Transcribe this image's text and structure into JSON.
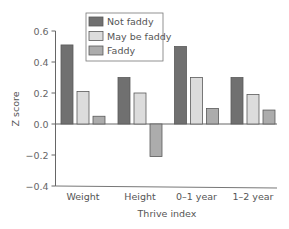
{
  "chart_data": {
    "type": "bar",
    "title": "",
    "xlabel": "Thrive index",
    "ylabel": "Z score",
    "categories": [
      "Weight",
      "Height",
      "0–1 year",
      "1–2 year"
    ],
    "series": [
      {
        "name": "Not faddy",
        "values": [
          0.51,
          0.3,
          0.5,
          0.3
        ],
        "color": "#707070"
      },
      {
        "name": "May be faddy",
        "values": [
          0.21,
          0.2,
          0.3,
          0.19
        ],
        "color": "#dcdcdc"
      },
      {
        "name": "Faddy",
        "values": [
          0.05,
          -0.21,
          0.1,
          0.09
        ],
        "color": "#acacac"
      }
    ],
    "ylim": [
      -0.4,
      0.6
    ],
    "yticks": [
      0.6,
      0.4,
      0.2,
      0.0,
      -0.2,
      -0.4
    ],
    "ytick_labels": [
      "0.6",
      "0.4",
      "0.2",
      "0.0",
      "−0.2",
      "−0.4"
    ],
    "grid": false,
    "legend_position": "top-center"
  },
  "legend": {
    "items": [
      {
        "label": "Not faddy",
        "color": "#707070"
      },
      {
        "label": "May be faddy",
        "color": "#dcdcdc"
      },
      {
        "label": "Faddy",
        "color": "#acacac"
      }
    ]
  },
  "axes": {
    "xlabel": "Thrive index",
    "ylabel": "Z score"
  }
}
